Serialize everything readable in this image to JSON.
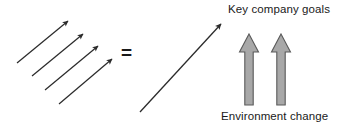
{
  "diagram": {
    "title_text": "Key company goals",
    "bottom_text": "Environment change",
    "operator": "=",
    "colors": {
      "background": "#ffffff",
      "line": "#2b2b2b",
      "text": "#1a1a1a",
      "block_arrow_fill": "#a8a8a8",
      "block_arrow_stroke": "#5a5a5a"
    },
    "left_group": {
      "name": "four-parallel-thin-arrows",
      "count": 4,
      "arrows": [
        {
          "x1": 17,
          "y1": 63,
          "x2": 68,
          "y2": 21
        },
        {
          "x1": 32,
          "y1": 76,
          "x2": 83,
          "y2": 34
        },
        {
          "x1": 45,
          "y1": 90,
          "x2": 98,
          "y2": 46
        },
        {
          "x1": 59,
          "y1": 104,
          "x2": 112,
          "y2": 59
        }
      ]
    },
    "right_group": {
      "resultant_arrow": {
        "x1": 140,
        "y1": 112,
        "x2": 221,
        "y2": 24
      },
      "block_arrows": [
        {
          "name": "block-arrow-left",
          "cx": 249,
          "top": 34,
          "bottom": 105
        },
        {
          "name": "block-arrow-right",
          "cx": 281,
          "top": 34,
          "bottom": 105
        }
      ]
    }
  }
}
